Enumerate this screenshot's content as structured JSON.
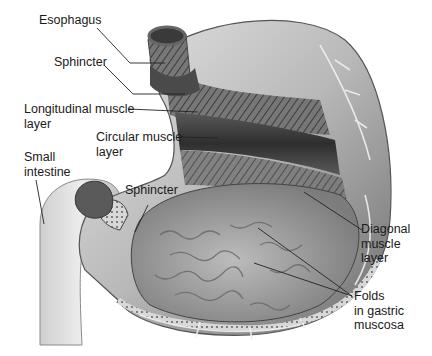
{
  "diagram": {
    "colors": {
      "background": "#ffffff",
      "text": "#1a1a1a",
      "leader_line": "#222222",
      "stomach_light": "#d9d9d9",
      "stomach_mid": "#9a9a9a",
      "stomach_dark": "#4a4a4a",
      "mucosa": "#b5b5b5",
      "intestine": "#e0e0e0"
    },
    "labels": [
      {
        "id": "esophagus",
        "text": "Esophagus",
        "x": 39,
        "y": 20
      },
      {
        "id": "sphincter-top",
        "text": "Sphincter",
        "x": 54,
        "y": 57
      },
      {
        "id": "longitudinal-muscle",
        "text": "Longitudinal muscle\nlayer",
        "x": 24,
        "y": 100
      },
      {
        "id": "circular-muscle",
        "text": "Circular muscle\nlayer",
        "x": 96,
        "y": 125
      },
      {
        "id": "small-intestine",
        "text": "Small\nintestine",
        "x": 25,
        "y": 148
      },
      {
        "id": "sphincter-bottom",
        "text": "Sphincter",
        "x": 125,
        "y": 180
      },
      {
        "id": "diagonal-muscle",
        "text": "Diagonal\nmuscle\nlayer",
        "x": 361,
        "y": 222
      },
      {
        "id": "gastric-folds",
        "text": "Folds\nin gastric\nmuscosa",
        "x": 354,
        "y": 290
      }
    ]
  }
}
